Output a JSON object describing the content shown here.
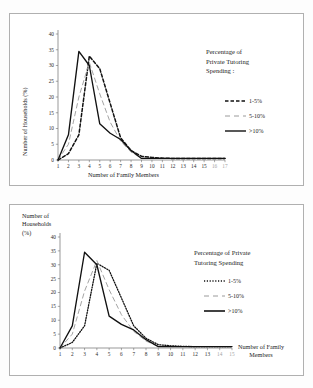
{
  "page": {
    "background": "#fdfdfd",
    "frame_color": "#b0b0b0"
  },
  "chart_data": [
    {
      "id": "top",
      "type": "line",
      "title": "",
      "xlabel": "Number of Family Members",
      "ylabel": "Number of Households (%)",
      "xlim": [
        1,
        17
      ],
      "ylim": [
        0,
        40
      ],
      "ytick_step": 5,
      "grid": false,
      "legend_position": "right",
      "legend_title": "Percentage of Private Tutoring Spending :",
      "legend_title_lines": [
        "Percentage of",
        "Private Tutoring",
        "Spending :"
      ],
      "x": [
        1,
        2,
        3,
        4,
        5,
        6,
        7,
        8,
        9,
        10,
        11,
        12,
        13,
        14,
        15,
        16,
        17
      ],
      "xtick_labels": [
        "1",
        "2",
        "3",
        "4",
        "5",
        "6",
        "7",
        "8",
        "9",
        "10",
        "11",
        "12",
        "13",
        "14",
        "15",
        "16",
        "17"
      ],
      "ytick_labels": [
        "0",
        "5",
        "10",
        "15",
        "20",
        "25",
        "30",
        "35",
        "40"
      ],
      "series": [
        {
          "name": "1-5%",
          "style": "dashed",
          "color": "#111111",
          "values": [
            0,
            2,
            8,
            33,
            29,
            18,
            7,
            3,
            1.2,
            0.8,
            0.6,
            0.5,
            0.5,
            0.5,
            0.5,
            0.5,
            0.5
          ]
        },
        {
          "name": "5-10%",
          "style": "dash-gap",
          "color": "#9a9a9a",
          "values": [
            0,
            5,
            20,
            31,
            21,
            12,
            6,
            2.5,
            0.6,
            0.5,
            0.5,
            0.5,
            0.5,
            0.5,
            0.5,
            0.5,
            0.5
          ]
        },
        {
          "name": ">10%",
          "style": "solid",
          "color": "#111111",
          "values": [
            0,
            8,
            34.5,
            30,
            11.5,
            8.5,
            6.5,
            3,
            0.5,
            0.5,
            0.5,
            0.5,
            0.5,
            0.5,
            0.5,
            0.5,
            0.5
          ]
        }
      ]
    },
    {
      "id": "bottom",
      "type": "line",
      "title": "",
      "xlabel": "Number of Family Members",
      "xlabel_lines": [
        "Number of Family",
        "Members"
      ],
      "ylabel": "Number of Households (%)",
      "ylabel_lines": [
        "Number of",
        "Households",
        "(%)"
      ],
      "xlim": [
        1,
        15
      ],
      "ylim": [
        0,
        40
      ],
      "ytick_step": 5,
      "grid": false,
      "legend_position": "right",
      "legend_title": "Percentage of Private Tutoring Spending",
      "legend_title_lines": [
        "Percentage of Private",
        "Tutoring Spending"
      ],
      "x": [
        1,
        2,
        3,
        4,
        5,
        6,
        7,
        8,
        9,
        10,
        11,
        12,
        13,
        14,
        15
      ],
      "xtick_labels": [
        "1",
        "2",
        "3",
        "4",
        "5",
        "6",
        "7",
        "8",
        "9",
        "10",
        "11",
        "12",
        "13",
        "14",
        "15"
      ],
      "ytick_labels": [
        "0",
        "5",
        "10",
        "15",
        "20",
        "25",
        "30",
        "35",
        "40"
      ],
      "series": [
        {
          "name": "1-5%",
          "style": "dotted",
          "color": "#111111",
          "values": [
            0,
            2,
            8,
            30.5,
            28,
            18,
            8,
            3.5,
            1.2,
            0.8,
            0.6,
            0.5,
            0.5,
            0.5,
            0.5
          ]
        },
        {
          "name": "5-10%",
          "style": "dash-gap",
          "color": "#9a9a9a",
          "values": [
            0,
            5,
            20.5,
            31.5,
            21,
            12,
            6,
            2.5,
            0.6,
            0.5,
            0.5,
            0.5,
            0.5,
            0.5,
            0.5
          ]
        },
        {
          "name": ">10%",
          "style": "solid",
          "color": "#111111",
          "values": [
            0,
            8,
            34.5,
            30,
            11.5,
            8.5,
            6.5,
            3,
            0.5,
            0.5,
            0.5,
            0.5,
            0.5,
            0.5,
            0.5
          ]
        }
      ]
    }
  ]
}
